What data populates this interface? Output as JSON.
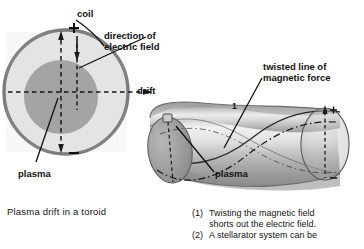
{
  "figure": {
    "title_left": "Plasma drift in a toroid",
    "left_diagram": {
      "name": "toroid-cross-section",
      "labels": {
        "coil": "coil",
        "direction_line1": "direction of",
        "direction_line2": "electric field",
        "drift": "drift",
        "plasma": "plasma",
        "charge_positive": "+",
        "charge_negative": "−"
      },
      "colors": {
        "coil_ring": "#7d7d7d",
        "vessel_fill": "#e3e3e3",
        "plasma_fill": "#a3a3a3",
        "line": "#1a1a1a"
      }
    },
    "right_diagram": {
      "name": "twisted-torus",
      "labels": {
        "twisted_line1": "twisted line of",
        "twisted_line2": "magnetic force",
        "plasma": "plasma",
        "marker_one": "1",
        "charge_positive": "+",
        "charge_negative": "−"
      },
      "colors": {
        "tube_light": "#efefef",
        "tube_mid": "#b4b4b4",
        "tube_dark": "#8e8e8e",
        "end_cap": "#9b9b9b",
        "line": "#1a1a1a"
      }
    },
    "notes": [
      {
        "number": "(1)",
        "line1": "Twisting the magnetic field",
        "line2": "shorts out the electric field."
      },
      {
        "number": "(2)",
        "line1": "A stellarator system can be",
        "line2": ""
      }
    ]
  }
}
